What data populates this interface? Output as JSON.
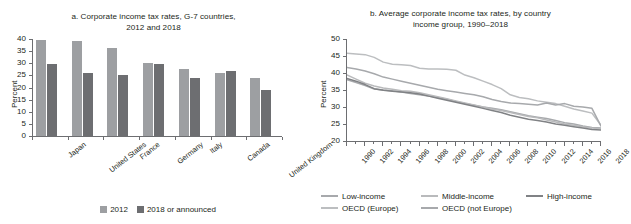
{
  "chart_data": [
    {
      "type": "bar",
      "panel": "a",
      "title": "a. Corporate income tax rates, G-7 countries, 2012 and 2018",
      "title_line1": "a. Corporate income tax rates, G-7 countries,",
      "title_line2": "2012 and 2018",
      "xlabel": "",
      "ylabel": "Percent",
      "ylim": [
        0,
        40
      ],
      "yticks": [
        0,
        5,
        10,
        15,
        20,
        25,
        30,
        35,
        40
      ],
      "grid": false,
      "legend_position": "bottom",
      "categories": [
        "Japan",
        "United States",
        "France",
        "Germany",
        "Italy",
        "Canada",
        "United Kingdom"
      ],
      "series": [
        {
          "name": "2012",
          "color": "#9d9fa2",
          "values": [
            39.5,
            39.1,
            36.1,
            30.2,
            27.5,
            26.1,
            24.0
          ]
        },
        {
          "name": "2018 or announced",
          "color": "#6d6e71",
          "values": [
            29.7,
            25.8,
            25.0,
            29.8,
            24.0,
            26.8,
            19.0
          ]
        }
      ]
    },
    {
      "type": "line",
      "panel": "b",
      "title": "b. Average corporate income tax rates, by country income group, 1990–2018",
      "title_line1": "b. Average corporate income tax rates, by country",
      "title_line2": "income group, 1990–2018",
      "xlabel": "",
      "ylabel": "Percent",
      "ylim": [
        20,
        50
      ],
      "yticks": [
        20,
        25,
        30,
        35,
        40,
        45,
        50
      ],
      "xlim": [
        1990,
        2018
      ],
      "xticks": [
        1990,
        1992,
        1994,
        1996,
        1998,
        2000,
        2002,
        2004,
        2006,
        2008,
        2010,
        2012,
        2014,
        2016,
        2018
      ],
      "grid": false,
      "legend_position": "bottom",
      "x": [
        1990,
        1991,
        1992,
        1993,
        1994,
        1995,
        1996,
        1997,
        1998,
        1999,
        2000,
        2001,
        2002,
        2003,
        2004,
        2005,
        2006,
        2007,
        2008,
        2009,
        2010,
        2011,
        2012,
        2013,
        2014,
        2015,
        2016,
        2017,
        2018
      ],
      "series": [
        {
          "name": "Low-income",
          "color": "#a7a9ac",
          "values": [
            38.0,
            37.2,
            36.3,
            35.3,
            35.0,
            34.8,
            34.4,
            34.0,
            33.6,
            33.2,
            32.8,
            32.3,
            31.6,
            31.0,
            30.5,
            30.0,
            29.6,
            29.2,
            28.6,
            28.0,
            27.4,
            27.0,
            26.6,
            26.0,
            25.4,
            25.0,
            24.4,
            24.0,
            23.8
          ]
        },
        {
          "name": "Middle-income",
          "color": "#b9babc",
          "values": [
            39.4,
            38.2,
            37.0,
            36.2,
            35.6,
            35.2,
            34.8,
            34.6,
            34.2,
            33.6,
            33.0,
            32.4,
            31.8,
            31.2,
            30.6,
            30.0,
            29.4,
            29.0,
            28.4,
            27.8,
            27.2,
            26.8,
            26.2,
            25.6,
            25.0,
            24.6,
            24.2,
            23.8,
            23.6
          ]
        },
        {
          "name": "High-income",
          "color": "#808285",
          "values": [
            38.4,
            37.6,
            36.6,
            35.4,
            34.9,
            34.6,
            34.4,
            34.2,
            33.8,
            33.2,
            32.6,
            32.0,
            31.4,
            30.8,
            30.2,
            29.6,
            29.0,
            28.4,
            27.6,
            27.0,
            26.4,
            26.0,
            25.6,
            25.0,
            24.6,
            24.2,
            23.8,
            23.4,
            23.2
          ]
        },
        {
          "name": "OECD (Europe)",
          "color": "#bcbec0",
          "values": [
            45.8,
            45.6,
            45.4,
            44.6,
            43.2,
            42.6,
            42.4,
            42.2,
            41.4,
            41.2,
            41.2,
            41.1,
            40.8,
            39.4,
            38.6,
            37.6,
            36.6,
            35.4,
            33.6,
            32.8,
            32.4,
            31.8,
            31.4,
            31.0,
            30.2,
            29.4,
            28.8,
            28.2,
            24.6
          ]
        },
        {
          "name": "OECD (not Europe)",
          "color": "#a7a9ac",
          "values": [
            41.6,
            41.2,
            40.6,
            39.8,
            38.8,
            38.2,
            37.6,
            37.0,
            36.4,
            35.8,
            35.2,
            34.8,
            34.4,
            34.0,
            33.6,
            33.0,
            32.2,
            31.6,
            31.2,
            31.0,
            30.8,
            30.6,
            31.2,
            30.6,
            31.0,
            30.2,
            30.0,
            29.6,
            24.4
          ]
        }
      ]
    }
  ],
  "panel_a": {
    "title_line1": "a. Corporate income tax rates, G-7 countries,",
    "title_line2": "2012 and 2018",
    "ylabel": "Percent",
    "yticks": [
      "40",
      "35",
      "30",
      "25",
      "20",
      "15",
      "10",
      "5",
      "0"
    ],
    "categories": [
      "Japan",
      "United States",
      "France",
      "Germany",
      "Italy",
      "Canada",
      "United Kingdom"
    ],
    "legend": [
      {
        "label": "2012",
        "color": "#9d9fa2"
      },
      {
        "label": "2018 or announced",
        "color": "#6d6e71"
      }
    ]
  },
  "panel_b": {
    "title_line1": "b. Average corporate income tax rates, by country",
    "title_line2": "income group, 1990–2018",
    "ylabel": "Percent",
    "yticks": [
      "50",
      "45",
      "40",
      "35",
      "30",
      "25",
      "20"
    ],
    "xticks": [
      "1990",
      "1992",
      "1994",
      "1996",
      "1998",
      "2000",
      "2002",
      "2004",
      "2006",
      "2008",
      "2010",
      "2012",
      "2014",
      "2016",
      "2018"
    ],
    "legend_row1": [
      {
        "label": "Low-income",
        "color": "#a7a9ac"
      },
      {
        "label": "Middle-income",
        "color": "#b9babc"
      },
      {
        "label": "High-income",
        "color": "#808285"
      }
    ],
    "legend_row2": [
      {
        "label": "OECD (Europe)",
        "color": "#bcbec0"
      },
      {
        "label": "OECD (not Europe)",
        "color": "#a7a9ac"
      }
    ]
  }
}
